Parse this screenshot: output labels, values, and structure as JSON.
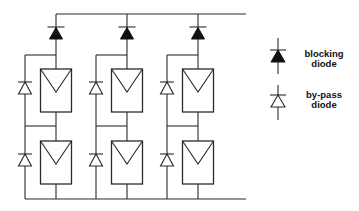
{
  "diagram": {
    "strings": [
      {
        "id": "string-1",
        "modules": 2,
        "blocking_diodes": 1,
        "bypass_diodes": 2
      },
      {
        "id": "string-2",
        "modules": 2,
        "blocking_diodes": 1,
        "bypass_diodes": 2
      },
      {
        "id": "string-3",
        "modules": 2,
        "blocking_diodes": 1,
        "bypass_diodes": 2
      }
    ],
    "legend": {
      "blocking": {
        "line1": "blocking",
        "line2": "diode"
      },
      "bypass": {
        "line1": "by-pass",
        "line2": "diode"
      }
    },
    "colors": {
      "line": "#2a2a2a",
      "filled_diode": "#111111",
      "background": "#ffffff"
    }
  }
}
